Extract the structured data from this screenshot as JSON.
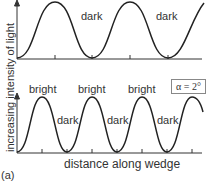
{
  "figure": {
    "panel_label": "(a)",
    "y_axis_label": "increasing intensity of light",
    "x_axis_label": "distance along wedge",
    "alpha_label": "α = 2°",
    "top_panel": {
      "dark_labels": [
        "dark",
        "dark"
      ]
    },
    "bottom_panel": {
      "bright_labels": [
        "bright",
        "bright",
        "bright"
      ],
      "dark_labels": [
        "dark",
        "dark",
        "dark"
      ]
    }
  }
}
